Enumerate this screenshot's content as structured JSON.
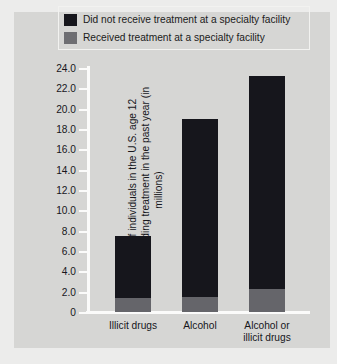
{
  "chart_data": {
    "type": "bar",
    "subtype": "stacked-bar",
    "title": "",
    "xlabel": "",
    "ylabel": "Number of individuals in the U.S. age 12 or older needing treatment in the past year (in millions)",
    "ylabel_lines": [
      "Number of individuals in the U.S. age 12",
      "or older needing treatment in the past year (in millions)"
    ],
    "categories": [
      "Illicit drugs",
      "Alcohol",
      "Alcohol or illicit drugs"
    ],
    "category_lines": [
      [
        "Illicit drugs"
      ],
      [
        "Alcohol"
      ],
      [
        "Alcohol or",
        "illicit drugs"
      ]
    ],
    "series": [
      {
        "name": "Received treatment at a specialty facility",
        "color": "#65656a",
        "values": [
          1.4,
          1.5,
          2.3
        ]
      },
      {
        "name": "Did not receive treatment at a specialty facility",
        "color": "#16161c",
        "values": [
          6.1,
          17.5,
          20.9
        ]
      }
    ],
    "totals": [
      7.5,
      19.0,
      23.2
    ],
    "ylim": [
      0,
      24.0
    ],
    "yticks": [
      0,
      2.0,
      4.0,
      6.0,
      8.0,
      10.0,
      12.0,
      14.0,
      16.0,
      18.0,
      20.0,
      22.0,
      24.0
    ],
    "ytick_labels": [
      "0",
      "2.0",
      "4.0",
      "6.0",
      "8.0",
      "10.0",
      "12.0",
      "14.0",
      "16.0",
      "18.0",
      "20.0",
      "22.0",
      "24.0"
    ],
    "grid": false,
    "legend_position": "top",
    "legend": [
      {
        "label": "Did not receive treatment at a specialty facility",
        "swatch": "dark"
      },
      {
        "label": "Received treatment at a specialty facility",
        "swatch": "light"
      }
    ],
    "colors": {
      "panel_background": "#d6d6d4",
      "figure_background": "#ececeb",
      "axis_line": "#fbfbfa",
      "text": "#17171c",
      "did_not_receive": "#16161c",
      "received": "#65656a"
    }
  }
}
